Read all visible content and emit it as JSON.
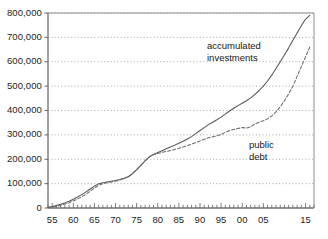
{
  "chart_data": {
    "type": "line",
    "title": "",
    "subtitle": "",
    "xlabel": "",
    "ylabel": "",
    "grid": true,
    "gridlines": "horizontal dotted at each 100,000 step",
    "legend_position": "inline annotations next to curves",
    "xlim": [
      1954,
      2017
    ],
    "ylim": [
      0,
      800000
    ],
    "y_ticks": [
      0,
      100000,
      200000,
      300000,
      400000,
      500000,
      600000,
      700000,
      800000
    ],
    "y_tick_labels": [
      "0",
      "100,000",
      "200,000",
      "300,000",
      "400,000",
      "500,000",
      "600,000",
      "700,000",
      "800,000"
    ],
    "x_ticks": [
      1955,
      1960,
      1965,
      1970,
      1975,
      1980,
      1985,
      1990,
      1995,
      2000,
      2005,
      2015
    ],
    "x_tick_labels": [
      "55",
      "60",
      "65",
      "70",
      "75",
      "80",
      "85",
      "90",
      "95",
      "00",
      "05",
      "15"
    ],
    "x_minor_ticks": "every year",
    "annotations": [
      {
        "name": "accumulated-investments",
        "lines": [
          "accumulated",
          "investments"
        ],
        "x_px": 207,
        "y_px": 40
      },
      {
        "name": "public-debt",
        "lines": [
          "public",
          "debt"
        ],
        "x_px": 249,
        "y_px": 139
      }
    ],
    "series": [
      {
        "name": "accumulated investments",
        "style": "solid",
        "color": "#555555",
        "x": [
          1954,
          1955,
          1956,
          1957,
          1958,
          1959,
          1960,
          1961,
          1962,
          1963,
          1964,
          1965,
          1966,
          1967,
          1968,
          1969,
          1970,
          1971,
          1972,
          1973,
          1974,
          1975,
          1976,
          1977,
          1978,
          1979,
          1980,
          1981,
          1982,
          1983,
          1984,
          1985,
          1986,
          1987,
          1988,
          1989,
          1990,
          1991,
          1992,
          1993,
          1994,
          1995,
          1996,
          1997,
          1998,
          1999,
          2000,
          2001,
          2002,
          2003,
          2004,
          2005,
          2006,
          2007,
          2008,
          2009,
          2010,
          2011,
          2012,
          2013,
          2014,
          2015,
          2016
        ],
        "values": [
          3000,
          6000,
          10000,
          15000,
          21000,
          28000,
          36000,
          45000,
          55000,
          66000,
          78000,
          90000,
          99000,
          104000,
          107000,
          110000,
          113000,
          117000,
          122000,
          128000,
          140000,
          157000,
          175000,
          193000,
          210000,
          220000,
          228000,
          235000,
          243000,
          250000,
          258000,
          266000,
          274000,
          283000,
          293000,
          305000,
          318000,
          330000,
          342000,
          352000,
          362000,
          373000,
          385000,
          398000,
          409000,
          420000,
          430000,
          440000,
          452000,
          466000,
          482000,
          500000,
          521000,
          545000,
          572000,
          600000,
          628000,
          657000,
          688000,
          718000,
          748000,
          775000,
          790000
        ]
      },
      {
        "name": "public debt",
        "style": "dashed",
        "color": "#6b6b6b",
        "x": [
          1954,
          1955,
          1956,
          1957,
          1958,
          1959,
          1960,
          1961,
          1962,
          1963,
          1964,
          1965,
          1966,
          1967,
          1968,
          1969,
          1970,
          1971,
          1972,
          1973,
          1974,
          1975,
          1976,
          1977,
          1978,
          1979,
          1980,
          1981,
          1982,
          1983,
          1984,
          1985,
          1986,
          1987,
          1988,
          1989,
          1990,
          1991,
          1992,
          1993,
          1994,
          1995,
          1996,
          1997,
          1998,
          1999,
          2000,
          2001,
          2002,
          2003,
          2004,
          2005,
          2006,
          2007,
          2008,
          2009,
          2010,
          2011,
          2012,
          2013,
          2014,
          2015,
          2016
        ],
        "values": [
          2000,
          4000,
          7000,
          11000,
          16000,
          22000,
          29000,
          37000,
          46000,
          57000,
          69000,
          82000,
          93000,
          100000,
          104000,
          107000,
          110000,
          115000,
          121000,
          128000,
          141000,
          158000,
          176000,
          194000,
          209000,
          218000,
          224000,
          228000,
          232000,
          236000,
          240000,
          245000,
          250000,
          256000,
          262000,
          268000,
          275000,
          282000,
          288000,
          292000,
          296000,
          302000,
          310000,
          318000,
          322000,
          326000,
          330000,
          328000,
          333000,
          345000,
          352000,
          358000,
          366000,
          378000,
          394000,
          415000,
          440000,
          468000,
          500000,
          540000,
          580000,
          620000,
          660000
        ]
      }
    ]
  },
  "axes": {
    "plot_left_px": 48,
    "plot_right_px": 314,
    "plot_top_px": 13,
    "plot_bottom_px": 208
  }
}
